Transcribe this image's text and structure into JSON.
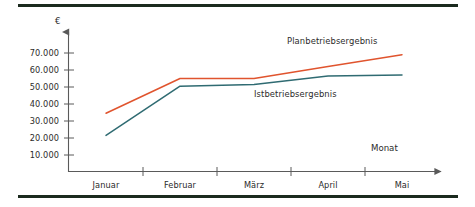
{
  "chart_data": {
    "type": "line",
    "title": "",
    "xlabel": "Monat",
    "ylabel": "€",
    "categories": [
      "Januar",
      "Februar",
      "März",
      "April",
      "Mai"
    ],
    "ytick_labels": [
      "10.000",
      "20.000",
      "30.000",
      "40.000",
      "50.000",
      "60.000",
      "70.000"
    ],
    "ytick_values": [
      10000,
      20000,
      30000,
      40000,
      50000,
      60000,
      70000
    ],
    "ylim": [
      0,
      78000
    ],
    "grid": false,
    "legend_position": "inline-annotations",
    "series": [
      {
        "name": "Planbetriebsergebnis",
        "color": "#E0542E",
        "values": [
          34500,
          55000,
          55000,
          62000,
          69000
        ]
      },
      {
        "name": "Istbetriebsergebnis",
        "color": "#2F6B72",
        "values": [
          21500,
          50500,
          51500,
          56500,
          57000
        ]
      }
    ],
    "annotations": [
      {
        "text": "Planbetriebsergebnis",
        "x": 287,
        "y": 36
      },
      {
        "text": "Istbetriebsergebnis",
        "x": 254,
        "y": 89
      },
      {
        "text": "Monat",
        "x": 371,
        "y": 143
      }
    ]
  },
  "axis": {
    "y_unit_label": "€",
    "x_axis_label": "Monat"
  },
  "colors": {
    "plan_series": "#E0542E",
    "ist_series": "#2F6B72",
    "axis": "#5a5a5a",
    "rule": "#1b2a1e",
    "text": "#2b2b2b"
  }
}
